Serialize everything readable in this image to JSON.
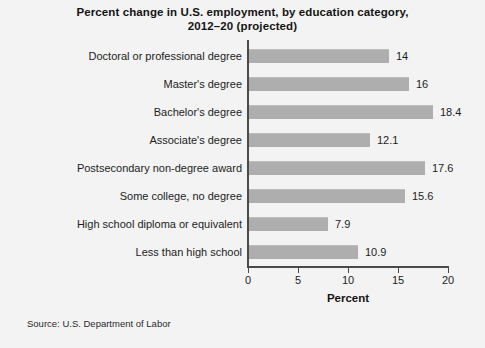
{
  "chart_data": {
    "type": "bar",
    "orientation": "horizontal",
    "title": "Percent change in U.S. employment, by education category, 2012–20 (projected)",
    "title_lines": [
      "Percent change in U.S. employment, by education category,",
      "2012–20 (projected)"
    ],
    "categories": [
      "Doctoral or professional degree",
      "Master's degree",
      "Bachelor's degree",
      "Associate's degree",
      "Postsecondary non-degree award",
      "Some college, no degree",
      "High school diploma or equivalent",
      "Less than high school"
    ],
    "values": [
      14,
      16,
      18.4,
      12.1,
      17.6,
      15.6,
      7.9,
      10.9
    ],
    "value_labels": [
      "14",
      "16",
      "18.4",
      "12.1",
      "17.6",
      "15.6",
      "7.9",
      "10.9"
    ],
    "xlabel": "Percent",
    "ylabel": "",
    "xlim": [
      0,
      20
    ],
    "xticks": [
      0,
      5,
      10,
      15,
      20
    ],
    "xtick_labels": [
      "0",
      "5",
      "10",
      "15",
      "20"
    ],
    "grid": false,
    "legend": false,
    "bar_color": "#aeaeae",
    "axis_color": "#4a4a4a",
    "background_color": "#f3f3f3",
    "text_color": "#1c1c1c"
  },
  "source": {
    "note": "Source: U.S. Department of Labor"
  }
}
